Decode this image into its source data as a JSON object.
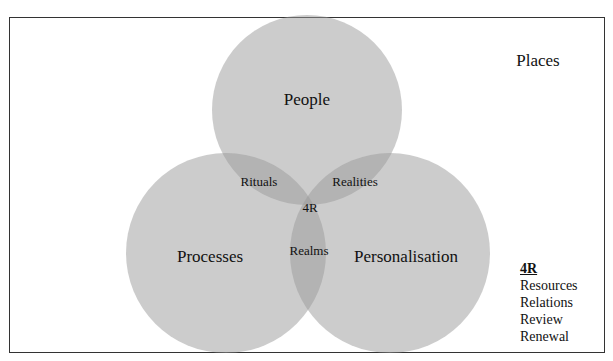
{
  "diagram": {
    "circles": [
      {
        "id": "people",
        "label": "People",
        "cx": 307,
        "cy": 110,
        "r": 95
      },
      {
        "id": "processes",
        "label": "Processes",
        "cx": 226,
        "cy": 253,
        "r": 100
      },
      {
        "id": "personalisation",
        "label": "Personalisation",
        "cx": 390,
        "cy": 253,
        "r": 100
      }
    ],
    "intersections": {
      "people_processes": "Rituals",
      "people_personalisation": "Realities",
      "processes_personalisation": "Realms",
      "all_three": "4R"
    },
    "outside_label": "Places",
    "legend": {
      "title": "4R",
      "items": [
        "Resources",
        "Relations",
        "Review",
        "Renewal"
      ]
    },
    "colors": {
      "circle_fill": "#b4b4b4",
      "frame": "#333333",
      "background": "#ffffff"
    }
  }
}
